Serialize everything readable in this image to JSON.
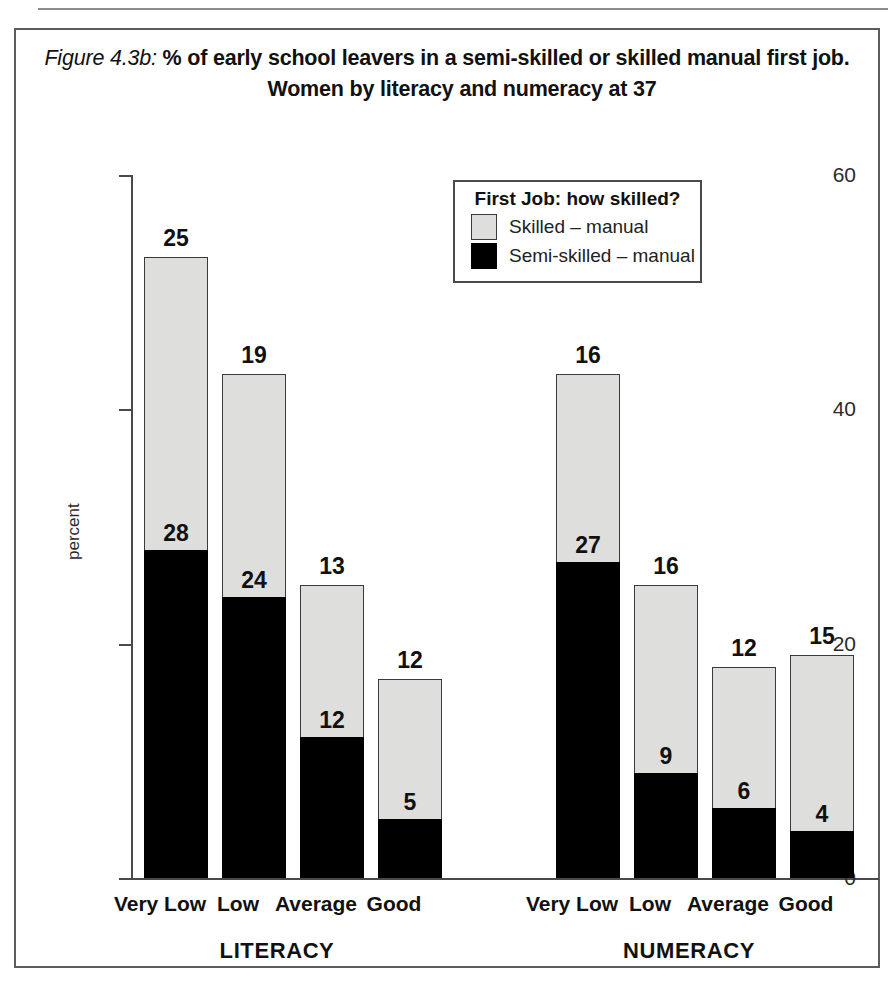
{
  "figure": {
    "label": "Figure 4.3b:",
    "title_line1": "% of early school leavers in a semi-skilled or skilled manual first job.",
    "title_line2": "Women by literacy and numeracy at 37"
  },
  "legend": {
    "title": "First Job: how skilled?",
    "items": [
      {
        "label": "Skilled – manual",
        "color": "#dededd",
        "icon": "legend-swatch-skilled"
      },
      {
        "label": "Semi-skilled – manual",
        "color": "#000000",
        "icon": "legend-swatch-semi-skilled"
      }
    ]
  },
  "axes": {
    "ylabel": "percent",
    "yticks": [
      "60",
      "40",
      "20",
      "0"
    ],
    "group_labels": [
      "LITERACY",
      "NUMERACY"
    ]
  },
  "chart_data": {
    "type": "bar",
    "subtype": "stacked",
    "title": "Figure 4.3b: % of early school leavers in a semi-skilled or skilled manual first job. Women by literacy and numeracy at 37",
    "xlabel": "",
    "ylabel": "percent",
    "ylim": [
      0,
      60
    ],
    "yticks": [
      0,
      20,
      40,
      60
    ],
    "grid": false,
    "legend_position": "top-center-inside",
    "groups": [
      "LITERACY",
      "NUMERACY"
    ],
    "categories": [
      "Very Low",
      "Low",
      "Average",
      "Good"
    ],
    "series": [
      {
        "name": "Semi-skilled – manual",
        "color": "#000000",
        "values": {
          "LITERACY": [
            28,
            24,
            12,
            5
          ],
          "NUMERACY": [
            27,
            9,
            6,
            4
          ]
        }
      },
      {
        "name": "Skilled – manual",
        "color": "#dededd",
        "values": {
          "LITERACY": [
            25,
            19,
            13,
            12
          ],
          "NUMERACY": [
            16,
            16,
            12,
            15
          ]
        }
      }
    ],
    "totals": {
      "LITERACY": [
        53,
        43,
        25,
        17
      ],
      "NUMERACY": [
        43,
        25,
        18,
        19
      ]
    }
  },
  "bars": [
    {
      "group": "LITERACY",
      "category": "Very Low",
      "semi": 28,
      "skilled": 25
    },
    {
      "group": "LITERACY",
      "category": "Low",
      "semi": 24,
      "skilled": 19
    },
    {
      "group": "LITERACY",
      "category": "Average",
      "semi": 12,
      "skilled": 13
    },
    {
      "group": "LITERACY",
      "category": "Good",
      "semi": 5,
      "skilled": 12
    },
    {
      "group": "NUMERACY",
      "category": "Very Low",
      "semi": 27,
      "skilled": 16
    },
    {
      "group": "NUMERACY",
      "category": "Low",
      "semi": 9,
      "skilled": 16
    },
    {
      "group": "NUMERACY",
      "category": "Average",
      "semi": 6,
      "skilled": 12
    },
    {
      "group": "NUMERACY",
      "category": "Good",
      "semi": 4,
      "skilled": 15
    }
  ]
}
